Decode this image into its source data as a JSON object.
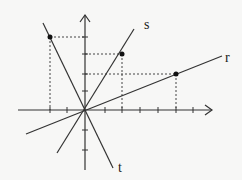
{
  "diagram": {
    "labels": {
      "s": "s",
      "r": "r",
      "t": "t"
    },
    "points": [
      {
        "line": "t",
        "x": -2,
        "y": 4
      },
      {
        "line": "s",
        "x": 2,
        "y": 3
      },
      {
        "line": "r",
        "x": 5,
        "y": 2
      }
    ],
    "colors": {
      "line": "#333333",
      "background": "#f7f7f6"
    }
  }
}
